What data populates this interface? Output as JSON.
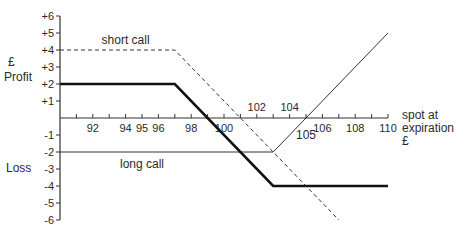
{
  "chart_data": {
    "type": "line",
    "title": "",
    "xlabel": "spot at expiration £",
    "ylabel": "£ Profit / Loss",
    "xlabel_lines": [
      "spot at",
      "expiration",
      "£"
    ],
    "ylabel_top_lines": [
      "£",
      "Profit"
    ],
    "ylabel_bottom": "Loss",
    "xlim": [
      90,
      110
    ],
    "ylim": [
      -6,
      6
    ],
    "x_tick_labels_below": [
      "92",
      "94",
      "95",
      "96",
      "98",
      "100",
      "106",
      "108",
      "110"
    ],
    "x_tick_labels_above": [
      "102",
      "104"
    ],
    "y_tick_labels": [
      "+6",
      "+5",
      "+4",
      "+3",
      "+2",
      "+1",
      "-1",
      "-2",
      "-3",
      "-4",
      "-5",
      "-6"
    ],
    "annotations": [
      {
        "text": "short call",
        "x": 94,
        "y": 4.6
      },
      {
        "text": "long call",
        "x": 95,
        "y": -2.7
      },
      {
        "text": "105",
        "x": 105,
        "y": -1.0
      }
    ],
    "grid": false,
    "legend": "none",
    "series": [
      {
        "name": "short call",
        "style": "dashed",
        "points": [
          [
            90,
            4
          ],
          [
            97,
            4
          ],
          [
            107,
            -6
          ]
        ]
      },
      {
        "name": "long call",
        "style": "thin-solid",
        "points": [
          [
            90,
            -2
          ],
          [
            103,
            -2
          ],
          [
            110,
            5
          ]
        ]
      },
      {
        "name": "combined (bear spread)",
        "style": "thick-solid",
        "points": [
          [
            90,
            2
          ],
          [
            97,
            2
          ],
          [
            103,
            -4
          ],
          [
            110,
            -4
          ]
        ]
      }
    ]
  }
}
